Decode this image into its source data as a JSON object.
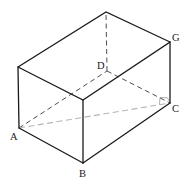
{
  "diagram": {
    "type": "cuboid",
    "labels": {
      "A": "A",
      "B": "B",
      "C": "C",
      "D": "D",
      "G": "G"
    },
    "vertices": {
      "A": [
        19,
        128
      ],
      "B": [
        83,
        163
      ],
      "C": [
        170,
        103
      ],
      "D": [
        107,
        71
      ],
      "G": [
        170,
        42
      ],
      "E_top_left": [
        18,
        67
      ],
      "F_top_front": [
        83,
        100
      ],
      "H_top_back": [
        106,
        12
      ]
    },
    "edges": {
      "visible": [
        "A-B",
        "B-C",
        "A-E",
        "B-F",
        "C-G",
        "E-F",
        "F-G",
        "E-H",
        "H-G"
      ],
      "hidden": [
        "A-D",
        "D-C",
        "D-H"
      ],
      "diagonal": [
        "A-C"
      ]
    },
    "annotations": {
      "right_angle_at": "C",
      "between": [
        "D-C",
        "A-C"
      ]
    },
    "colors": {
      "solid_edge": "#1a1a1a",
      "hidden_edge": "#3a3a3a",
      "diagonal": "#b5b5b5",
      "background": "#ffffff"
    }
  }
}
